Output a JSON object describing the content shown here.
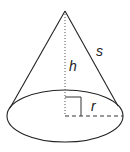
{
  "diagram": {
    "labels": {
      "slant_height": "s",
      "height": "h",
      "radius": "r"
    },
    "colors": {
      "stroke": "#222222",
      "background": "#ffffff"
    }
  }
}
